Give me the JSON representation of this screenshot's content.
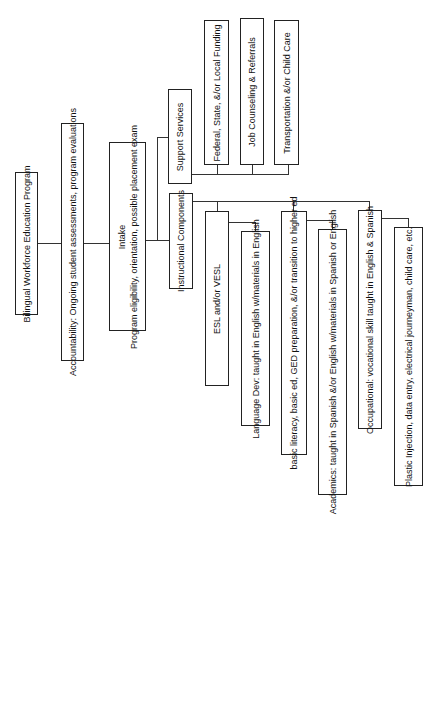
{
  "diagram": {
    "root": {
      "label": "Bilingual Workforce Education Program"
    },
    "accountability": {
      "label": "Accountability: Ongoing student assessments, program evaluations"
    },
    "intake": {
      "title": "Intake",
      "label": "Program eligibility, orientation, possible placement exam"
    },
    "support_services": {
      "label": "Support Services",
      "children": [
        {
          "label": "Federal, State, &/or Local Funding"
        },
        {
          "label": "Job Counseling & Referrals"
        },
        {
          "label": "Transportation &/or Child Care"
        }
      ]
    },
    "instructional_components": {
      "label": "Instructional Components",
      "children": [
        {
          "label": "ESL and/or VESL",
          "detail": "Language Dev: taught in English w/materials in English"
        },
        {
          "label": "basic literacy, basic ed, GED preparation, &/or transition to higher ed",
          "detail": "Academics: taught in Spanish &/or English w/materials in Spanish or English"
        },
        {
          "label": "Occupational: vocational skill taught in English & Spanish",
          "detail": "Plastic Injection, data entry, electrical journeyman, child care, etc."
        }
      ]
    }
  }
}
